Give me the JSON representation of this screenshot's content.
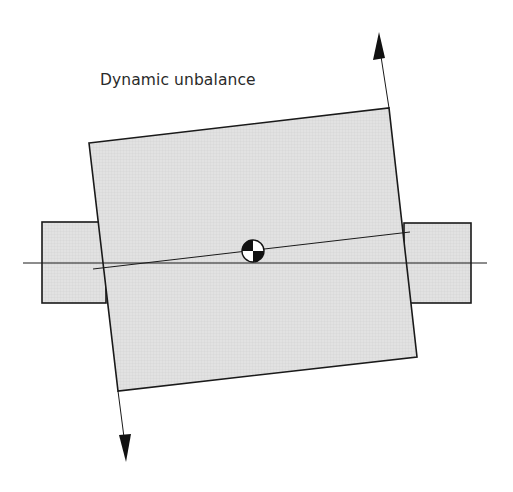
{
  "title": "Dynamic unbalance",
  "colors": {
    "fill": "#dddddd",
    "stroke": "#1a1a1a",
    "background": "#ffffff"
  },
  "geometry": {
    "rotor_corners": [
      [
        89,
        143
      ],
      [
        389,
        108
      ],
      [
        417,
        357
      ],
      [
        118,
        391
      ]
    ],
    "left_shaft": {
      "x": 42,
      "y": 222,
      "w": 64,
      "h": 81
    },
    "right_shaft": {
      "x": 404,
      "y": 223,
      "w": 67,
      "h": 80
    },
    "shaft_axis": {
      "x1": 23,
      "y1": 263,
      "x2": 487,
      "y2": 263
    },
    "principal_axis": {
      "x1": 93,
      "y1": 269,
      "x2": 410,
      "y2": 232
    },
    "center_of_mass": {
      "cx": 253,
      "cy": 251,
      "r": 11
    },
    "arrow_up": {
      "from": [
        389,
        108
      ],
      "tip": [
        379,
        32
      ]
    },
    "arrow_down": {
      "from": [
        118,
        391
      ],
      "tip": [
        126,
        462
      ]
    }
  }
}
